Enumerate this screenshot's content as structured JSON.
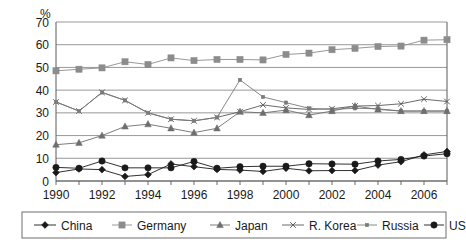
{
  "chart_data": {
    "type": "line",
    "title": "",
    "subtitle": "",
    "xlabel": "",
    "ylabel": "%",
    "unit_label": "%",
    "x": [
      1990,
      1991,
      1992,
      1993,
      1994,
      1995,
      1996,
      1997,
      1998,
      1999,
      2000,
      2001,
      2002,
      2003,
      2004,
      2005,
      2006,
      2007
    ],
    "xlim": [
      1990,
      2007
    ],
    "ylim": [
      0,
      70
    ],
    "ytick_labels": [
      "0",
      "10",
      "20",
      "30",
      "40",
      "50",
      "60",
      "70"
    ],
    "yticks": [
      0,
      10,
      20,
      30,
      40,
      50,
      60,
      70
    ],
    "xtick_labels": [
      "1990",
      "1992",
      "1994",
      "1996",
      "1998",
      "2000",
      "2002",
      "2004",
      "2006"
    ],
    "xticks": [
      1990,
      1992,
      1994,
      1996,
      1998,
      2000,
      2002,
      2004,
      2006
    ],
    "grid": true,
    "grid_axis": "y",
    "legend_position": "bottom",
    "series": [
      {
        "name": "China",
        "marker": "diamond",
        "color": "#1a1a1a",
        "values": [
          3.7,
          5.3,
          5.0,
          2.0,
          2.8,
          7.5,
          6.3,
          5.1,
          4.8,
          4.2,
          5.6,
          4.5,
          4.6,
          4.6,
          7.0,
          8.5,
          11.5,
          13.0
        ]
      },
      {
        "name": "Germany",
        "marker": "square",
        "color": "#8c8c8c",
        "values": [
          48.5,
          49.2,
          49.8,
          52.5,
          51.3,
          54.2,
          53.0,
          53.5,
          53.5,
          53.3,
          55.7,
          56.3,
          57.8,
          58.4,
          59.2,
          59.4,
          62.0,
          62.2
        ]
      },
      {
        "name": "Japan",
        "marker": "triangle",
        "color": "#6e6e6e",
        "values": [
          16.0,
          16.8,
          20.0,
          24.0,
          25.0,
          23.2,
          21.3,
          23.2,
          30.5,
          30.0,
          31.2,
          29.0,
          30.8,
          33.0,
          31.5,
          30.8,
          30.8,
          30.8
        ]
      },
      {
        "name": "R. Korea",
        "marker": "x",
        "color": "#5a5a5a",
        "values": [
          34.8,
          30.8,
          39.0,
          35.5,
          30.0,
          27.2,
          26.5,
          28.0,
          30.5,
          33.5,
          32.2,
          31.5,
          31.8,
          33.0,
          33.2,
          34.0,
          36.0,
          35.0
        ]
      },
      {
        "name": "Russia",
        "marker": "small-square",
        "color": "#7a7a7a",
        "values": [
          34.8,
          30.8,
          39.0,
          35.5,
          30.0,
          27.2,
          26.5,
          28.0,
          44.5,
          37.0,
          34.5,
          32.0,
          31.5,
          32.0,
          31.8,
          30.8,
          30.8,
          30.8
        ]
      },
      {
        "name": "US",
        "marker": "circle",
        "color": "#1a1a1a",
        "values": [
          6.0,
          5.6,
          8.8,
          5.8,
          5.8,
          5.8,
          8.6,
          5.6,
          6.3,
          6.5,
          6.5,
          7.6,
          7.5,
          7.4,
          8.8,
          9.5,
          11.0,
          12.0
        ]
      }
    ]
  },
  "legend": {
    "items": [
      {
        "label": "China",
        "marker": "diamond"
      },
      {
        "label": "Germany",
        "marker": "square"
      },
      {
        "label": "Japan",
        "marker": "triangle"
      },
      {
        "label": "R. Korea",
        "marker": "x"
      },
      {
        "label": "Russia",
        "marker": "small-square"
      },
      {
        "label": "US",
        "marker": "circle"
      }
    ]
  },
  "colors": {
    "axis": "#5a5a5a",
    "grid": "#8c8c8c",
    "text": "#1a1a1a",
    "legend_border": "#6e6e6e",
    "background": "#ffffff"
  }
}
